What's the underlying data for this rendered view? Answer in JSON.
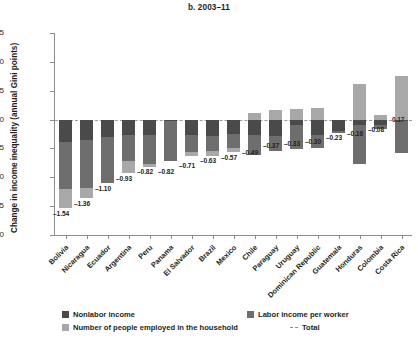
{
  "chart_data": {
    "type": "bar",
    "subtype": "stacked-bar-with-total",
    "title": "b. 2003–11",
    "xlabel": "",
    "ylabel": "Change in income inequality (annual Gini points)",
    "ylim": [
      -2.0,
      1.5
    ],
    "ytick_labels": [
      "1.5",
      "1.0",
      "0.5",
      "0",
      "–0.5",
      "–1.0",
      "–1.5",
      "–2.0"
    ],
    "ytick_values": [
      1.5,
      1.0,
      0.5,
      0,
      -0.5,
      -1.0,
      -1.5,
      -2.0
    ],
    "grid": false,
    "legend_position": "below",
    "categories": [
      "Bolivia",
      "Nicaragua",
      "Ecuador",
      "Argentina",
      "Peru",
      "Panama",
      "El Salvador",
      "Brazil",
      "Mexico",
      "Chile",
      "Paraguay",
      "Uruguay",
      "Dominican Republic",
      "Guatemala",
      "Honduras",
      "Colombia",
      "Costa Rica"
    ],
    "series": [
      {
        "name": "Nonlabor income",
        "color": "#4a4a4a",
        "values": [
          -0.39,
          -0.36,
          -0.31,
          -0.26,
          -0.26,
          -0.02,
          -0.27,
          -0.28,
          -0.25,
          -0.26,
          -0.29,
          -0.09,
          -0.26,
          -0.19,
          -0.09,
          -0.09,
          -0.03
        ]
      },
      {
        "name": "Labor income per worker",
        "color": "#6e6e6e",
        "values": [
          -0.82,
          -0.82,
          -0.79,
          -0.45,
          -0.51,
          -0.69,
          -0.29,
          -0.26,
          -0.25,
          -0.35,
          -0.25,
          -0.42,
          -0.24,
          -0.04,
          -0.68,
          -0.07,
          -0.55
        ]
      },
      {
        "name": "Number of people employed in the household",
        "color": "#a8a8a8",
        "values": [
          -0.33,
          -0.18,
          0.0,
          -0.22,
          -0.05,
          0.0,
          -0.07,
          -0.09,
          -0.07,
          0.12,
          0.17,
          0.18,
          0.2,
          0.0,
          0.61,
          0.08,
          0.75
        ]
      }
    ],
    "totals": {
      "label_prefix": "–",
      "values": [
        -1.54,
        -1.36,
        -1.1,
        -0.93,
        -0.82,
        -0.82,
        -0.71,
        -0.63,
        -0.57,
        -0.49,
        -0.37,
        -0.33,
        -0.3,
        -0.23,
        -0.16,
        -0.08,
        0.17
      ],
      "labels": [
        "–1.54",
        "–1.36",
        "–1.10",
        "–0.93",
        "–0.82",
        "–0.82",
        "–0.71",
        "–0.63",
        "–0.57",
        "–0.49",
        "–0.37",
        "–0.33",
        "–0.30",
        "–0.23",
        "–0.16",
        "–0.08",
        "0.17"
      ]
    },
    "legend": [
      {
        "label": "Nonlabor income",
        "swatch": "nonlabor"
      },
      {
        "label": "Labor income per worker",
        "swatch": "labor"
      },
      {
        "label": "Number of people employed in the household",
        "swatch": "people"
      },
      {
        "label": "Total",
        "swatch": "total"
      }
    ]
  }
}
